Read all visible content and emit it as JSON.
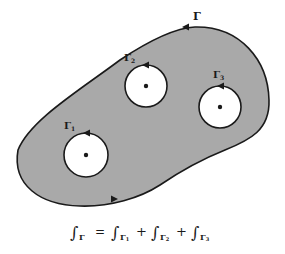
{
  "diagram": {
    "colors": {
      "region_fill": "#a9a9a9",
      "stroke": "#1a1a1a",
      "hole_fill": "#ffffff",
      "background": "#ffffff"
    },
    "outer_contour": {
      "label": "Γ",
      "orientation": "counterclockwise"
    },
    "holes": [
      {
        "id": "gamma1",
        "label": "Γ",
        "subscript": "1",
        "cx": 86,
        "cy": 155,
        "r": 22
      },
      {
        "id": "gamma2",
        "label": "Γ",
        "subscript": "2",
        "cx": 146,
        "cy": 86,
        "r": 21
      },
      {
        "id": "gamma3",
        "label": "Γ",
        "subscript": "3",
        "cx": 220,
        "cy": 107,
        "r": 21
      }
    ],
    "equation": {
      "integral": "∫",
      "lhs_sub": "Γ",
      "equals": "=",
      "plus": "+",
      "terms": [
        {
          "sub": "Γ",
          "index": "1"
        },
        {
          "sub": "Γ",
          "index": "2"
        },
        {
          "sub": "Γ",
          "index": "3"
        }
      ]
    }
  }
}
